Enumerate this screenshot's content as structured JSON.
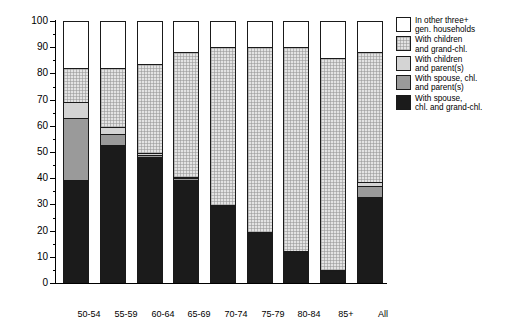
{
  "chart_data": {
    "type": "bar",
    "subtype": "stacked-bar-100pct",
    "title": "",
    "xlabel": "",
    "ylabel": "",
    "ylim": [
      0,
      100
    ],
    "ytick_step": 10,
    "yminor_step": 5,
    "grid": false,
    "legend_position": "right",
    "categories": [
      "50-54",
      "55-59",
      "60-64",
      "65-69",
      "70-74",
      "75-79",
      "80-84",
      "85+",
      "All"
    ],
    "yticks": [
      "0",
      "10",
      "20",
      "30",
      "40",
      "50",
      "60",
      "70",
      "80",
      "90",
      "100"
    ],
    "series": [
      {
        "name": "With spouse,\nchl. and grand-chl.",
        "key": "spouse-chl-grandchl",
        "fill": "f-black",
        "color": "#1b1b1b",
        "values": [
          39.5,
          52.5,
          48.0,
          39.5,
          29.0,
          19.0,
          11.5,
          4.5,
          33.0
        ]
      },
      {
        "name": "With spouse, chl.\nand parent(s)",
        "key": "spouse-chl-parents",
        "fill": "f-mgray",
        "color": "#9a9a9a",
        "values": [
          23.5,
          4.5,
          0.8,
          0.5,
          0.3,
          0.2,
          0.1,
          0.1,
          4.0
        ]
      },
      {
        "name": "With children\nand parent(s)",
        "key": "children-parents",
        "fill": "f-lgray",
        "color": "#d4d4d4",
        "values": [
          6.0,
          2.5,
          0.7,
          0.4,
          0.2,
          0.2,
          0.1,
          0.1,
          1.5
        ]
      },
      {
        "name": "With children\nand grand-chl.",
        "key": "children-grandchl",
        "fill": "f-dot",
        "color": "#e3e3e3",
        "values": [
          13.0,
          22.5,
          34.0,
          47.6,
          60.5,
          70.6,
          78.3,
          81.3,
          49.5
        ]
      },
      {
        "name": "In other three+\ngen. households",
        "key": "other-three-gen",
        "fill": "f-white",
        "color": "#ffffff",
        "values": [
          18.0,
          18.0,
          16.5,
          12.0,
          10.0,
          10.0,
          10.0,
          14.0,
          12.0
        ]
      }
    ],
    "stack_tops": [
      82.0,
      82.0,
      83.5,
      88.0,
      90.0,
      90.0,
      90.0,
      86.0,
      88.0
    ]
  },
  "legend": {
    "items": [
      {
        "label": "In other three+\ngen. households",
        "swatch": "f-white"
      },
      {
        "label": "With children\nand grand-chl.",
        "swatch": "f-dot"
      },
      {
        "label": "With children\nand parent(s)",
        "swatch": "f-lgray"
      },
      {
        "label": "With spouse, chl.\nand parent(s)",
        "swatch": "f-mgray"
      },
      {
        "label": "With spouse,\nchl. and grand-chl.",
        "swatch": "f-black"
      }
    ]
  }
}
